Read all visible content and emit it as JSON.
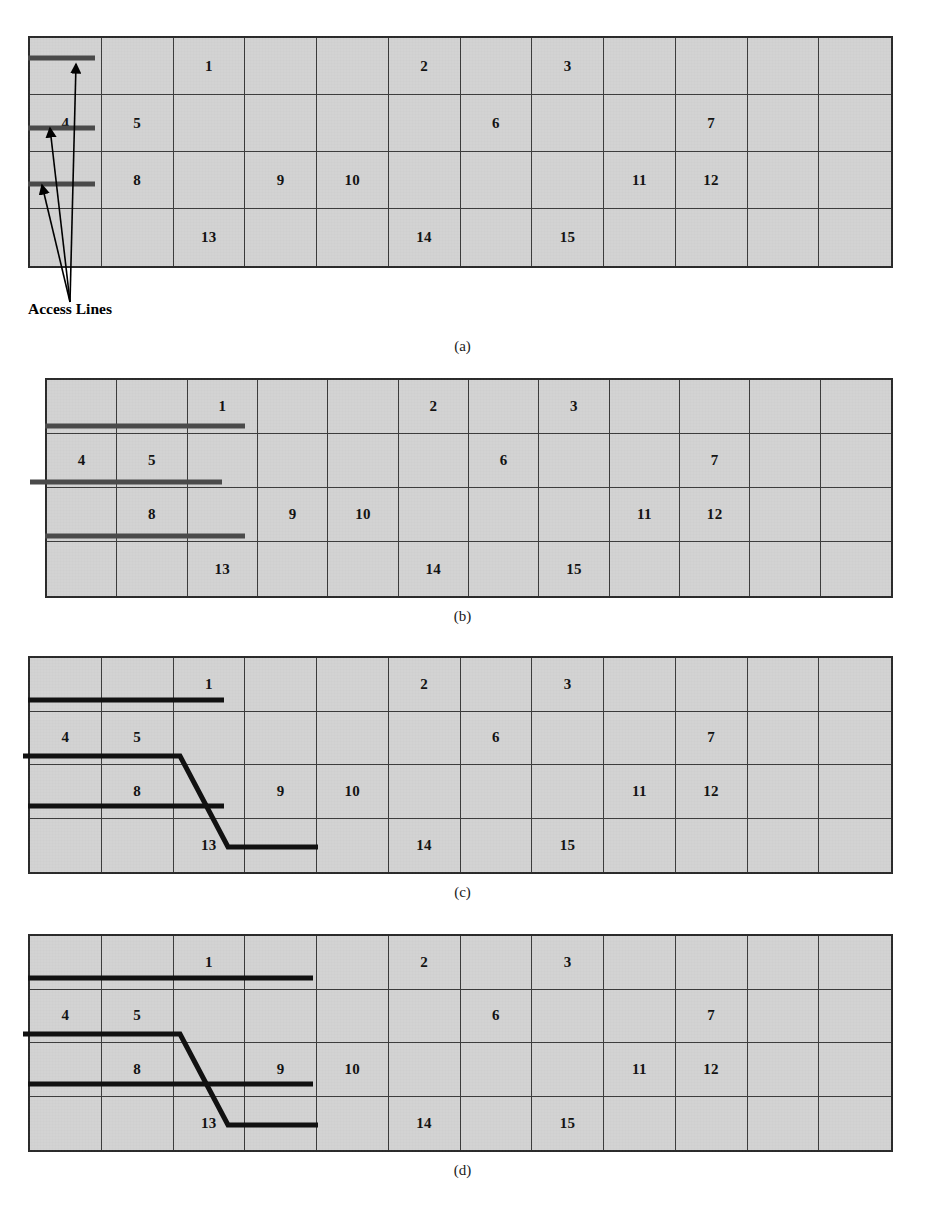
{
  "figure": {
    "type": "technical-diagram",
    "grid": {
      "columns": 12,
      "rows": 4,
      "fill_color": "#d3d3d3",
      "line_color": "#3a3a3a",
      "cell_labels": [
        [
          null,
          null,
          "1",
          null,
          null,
          "2",
          null,
          "3",
          null,
          null,
          null,
          null
        ],
        [
          "4",
          "5",
          null,
          null,
          null,
          null,
          "6",
          null,
          null,
          "7",
          null,
          null
        ],
        [
          null,
          "8",
          null,
          "9",
          "10",
          null,
          null,
          null,
          "11",
          "12",
          null,
          null
        ],
        [
          null,
          null,
          "13",
          null,
          null,
          "14",
          null,
          "15",
          null,
          null,
          null,
          null
        ]
      ]
    },
    "annotations": {
      "access_lines_label": "Access Lines",
      "access_line_color": "#4a4a4a"
    },
    "panels": [
      {
        "id": "a",
        "label": "(a)",
        "note": "Three short access-line stubs confined to the first column, with arrows pointing to them from the Access Lines caption",
        "lines": [
          {
            "name": "line-1",
            "row": 1,
            "x_start_col": 0,
            "x_end_col": 1
          },
          {
            "name": "line-2",
            "row": 2,
            "x_start_col": 0,
            "x_end_col": 1
          },
          {
            "name": "line-3",
            "row": 3,
            "x_start_col": 0,
            "x_end_col": 1
          }
        ]
      },
      {
        "id": "b",
        "label": "(b)",
        "note": "Access lines extended horizontally to the right across three columns",
        "lines": [
          {
            "name": "line-1",
            "row": 1,
            "x_start_col": 0,
            "x_end_col": 3
          },
          {
            "name": "line-2",
            "row": 2,
            "x_start_col": -0.2,
            "x_end_col": 2.75
          },
          {
            "name": "line-3",
            "row": 3,
            "x_start_col": 0,
            "x_end_col": 3
          }
        ]
      },
      {
        "id": "c",
        "label": "(c)",
        "note": "Middle access line bends diagonally down two rows into cell 13",
        "lines": [
          {
            "name": "line-1",
            "row": 1,
            "x_start_col": 0,
            "x_end_col": 2.75
          },
          {
            "name": "line-2-bent",
            "row": 2,
            "x_start_col": -0.05,
            "bend_col": 2.2,
            "drop_to_row": 4,
            "x_end_col": 4.0
          },
          {
            "name": "line-3",
            "row": 3,
            "x_start_col": 0,
            "x_end_col": 2.75
          }
        ]
      },
      {
        "id": "d",
        "label": "(d)",
        "note": "Same as (c) with the straight access lines extended further right",
        "lines": [
          {
            "name": "line-1",
            "row": 1,
            "x_start_col": 0,
            "x_end_col": 3.85
          },
          {
            "name": "line-2-bent",
            "row": 2,
            "x_start_col": -0.05,
            "bend_col": 2.2,
            "drop_to_row": 4,
            "x_end_col": 4.0
          },
          {
            "name": "line-3",
            "row": 3,
            "x_start_col": 0,
            "x_end_col": 3.85
          }
        ]
      }
    ],
    "caption": ""
  }
}
